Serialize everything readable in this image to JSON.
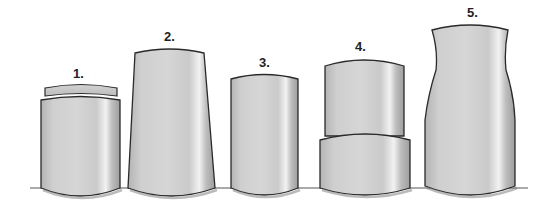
{
  "figure": {
    "shapes": [
      {
        "id": 1,
        "label": "1.",
        "form": "short cylinder with narrower lid on top"
      },
      {
        "id": 2,
        "label": "2.",
        "form": "tall tapered cylinder, wider at base"
      },
      {
        "id": 3,
        "label": "3.",
        "form": "straight cylinder"
      },
      {
        "id": 4,
        "label": "4.",
        "form": "stacked cylinders, narrower upper on wider lower"
      },
      {
        "id": 5,
        "label": "5.",
        "form": "bottle/vase shape with waisted neck"
      }
    ]
  },
  "colors": {
    "background": "#ffffff",
    "outline": "#2a2a2a",
    "fill_light": "#d9d9d9",
    "fill_mid": "#c4c4c4",
    "fill_dark": "#a8a8a8",
    "highlight": "#f4f4f4",
    "shadow": "#888888"
  }
}
